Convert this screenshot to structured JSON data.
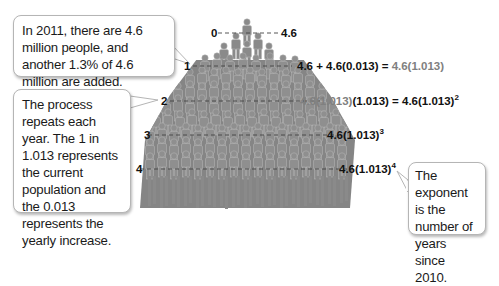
{
  "callouts": {
    "intro": "In 2011, there are 4.6 million people, and another 1.3% of 4.6 million are added.",
    "process": "The process repeats each year. The 1 in 1.013 represents the current population and the 0.013 represents the yearly increase.",
    "exponent": "The exponent is the number of years since 2010."
  },
  "years": [
    "0",
    "1",
    "2",
    "3",
    "4"
  ],
  "expressions": {
    "y0": "4.6",
    "y1_lhs": "4.6 + 4.6(0.013) = ",
    "y1_rhs": "4.6(1.013)",
    "y2_gray": "4.6(1.013)",
    "y2_rest": "(1.013) = 4.6(1.013)",
    "y2_exp": "2",
    "y3_base": "4.6(1.013)",
    "y3_exp": "3",
    "y4_base": "4.6(1.013)",
    "y4_exp": "4"
  },
  "colors": {
    "figure": "#8a8a8a",
    "figure_dark": "#6e6e6e",
    "highlight_text": "#808080",
    "text": "#111111",
    "callout_border": "#b5b5b5"
  }
}
